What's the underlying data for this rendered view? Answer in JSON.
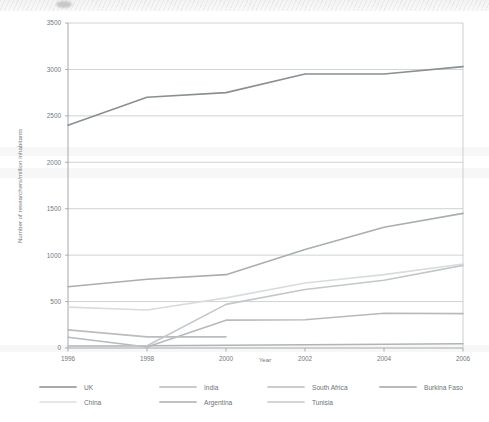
{
  "chart_data": {
    "type": "line",
    "title": "",
    "xlabel": "Year",
    "ylabel": "Number of researchers/million inhabitants",
    "x": [
      1996,
      1998,
      2000,
      2002,
      2004,
      2006
    ],
    "xtick_labels": [
      "1996",
      "1998",
      "2000",
      "2002",
      "2004",
      "2006"
    ],
    "ytick_labels": [
      "0",
      "500",
      "1000",
      "1500",
      "2000",
      "2500",
      "3000",
      "3500"
    ],
    "ytick_values": [
      0,
      500,
      1000,
      1500,
      2000,
      2500,
      3000,
      3500
    ],
    "xlim": [
      1996,
      2006
    ],
    "ylim": [
      0,
      3500
    ],
    "grid": "horizontal",
    "legend_position": "bottom",
    "series": [
      {
        "name": "UK",
        "color": "#8a8f92",
        "values": [
          2400,
          2700,
          2750,
          2950,
          2950,
          3030
        ]
      },
      {
        "name": "India",
        "color": "#b6babc",
        "values": [
          115,
          10,
          300,
          305,
          375,
          370
        ]
      },
      {
        "name": "South Africa",
        "color": "#b9bdbf",
        "values": [
          195,
          120,
          120,
          null,
          null,
          null
        ]
      },
      {
        "name": "Burkina Faso",
        "color": "#b0b4b6",
        "values": [
          20,
          25,
          30,
          35,
          40,
          45
        ]
      },
      {
        "name": "China",
        "color": "#d9dcdd",
        "values": [
          440,
          410,
          540,
          700,
          790,
          905
        ]
      },
      {
        "name": "Argentina",
        "color": "#a9aeb0",
        "values": [
          660,
          740,
          790,
          1060,
          1300,
          1450
        ]
      },
      {
        "name": "Tunisia",
        "color": "#c3c7c9",
        "values": [
          20,
          25,
          470,
          630,
          730,
          890
        ]
      }
    ]
  },
  "legend": {
    "rows": [
      [
        {
          "label": "UK",
          "color": "#8a8f92"
        },
        {
          "label": "India",
          "color": "#b6babc"
        },
        {
          "label": "South Africa",
          "color": "#b9bdbf"
        },
        {
          "label": "Burkina Faso",
          "color": "#9fa4a6"
        }
      ],
      [
        {
          "label": "China",
          "color": "#dcdfe0"
        },
        {
          "label": "Argentina",
          "color": "#a9aeb0"
        },
        {
          "label": "Tunisia",
          "color": "#c3c7c9"
        }
      ]
    ]
  },
  "colors": {
    "background": "#ffffff",
    "gridline": "#bfc3c5",
    "axis": "#9a9ea0",
    "text": "#74797c"
  }
}
